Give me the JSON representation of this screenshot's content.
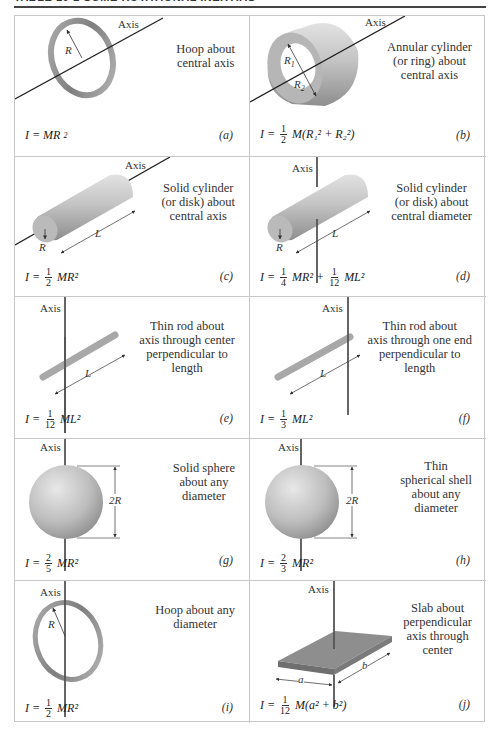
{
  "header": {
    "title": "TABLE 10-2 SOME ROTATIONAL INERTIAS"
  },
  "axis_label": "Axis",
  "panels": [
    {
      "id": "a",
      "letter": "(a)",
      "description": [
        "Hoop about",
        "central axis"
      ],
      "formula": {
        "prefix": "I = MR",
        "exp": "2"
      },
      "labels": [
        "R"
      ]
    },
    {
      "id": "b",
      "letter": "(b)",
      "description": [
        "Annular cylinder",
        "(or ring) about",
        "central axis"
      ],
      "formula": {
        "lhs": "I =",
        "frac": [
          "1",
          "2"
        ],
        "rest": "M(R₁² + R₂²)"
      },
      "labels": [
        "R1",
        "R2"
      ]
    },
    {
      "id": "c",
      "letter": "(c)",
      "description": [
        "Solid cylinder",
        "(or disk) about",
        "central axis"
      ],
      "formula": {
        "lhs": "I =",
        "frac": [
          "1",
          "2"
        ],
        "rest": "MR²"
      },
      "labels": [
        "R",
        "L"
      ]
    },
    {
      "id": "d",
      "letter": "(d)",
      "description": [
        "Solid cylinder",
        "(or disk) about",
        "central diameter"
      ],
      "formula": {
        "lhs": "I =",
        "frac": [
          "1",
          "4"
        ],
        "mid": "MR² +",
        "frac2": [
          "1",
          "12"
        ],
        "rest": "ML²"
      },
      "labels": [
        "R",
        "L"
      ]
    },
    {
      "id": "e",
      "letter": "(e)",
      "description": [
        "Thin rod about",
        "axis through center",
        "perpendicular to",
        "length"
      ],
      "formula": {
        "lhs": "I =",
        "frac": [
          "1",
          "12"
        ],
        "rest": "ML²"
      },
      "labels": [
        "L"
      ]
    },
    {
      "id": "f",
      "letter": "(f)",
      "description": [
        "Thin rod about",
        "axis through one end",
        "perpendicular to",
        "length"
      ],
      "formula": {
        "lhs": "I =",
        "frac": [
          "1",
          "3"
        ],
        "rest": "ML²"
      },
      "labels": [
        "L"
      ]
    },
    {
      "id": "g",
      "letter": "(g)",
      "description": [
        "Solid sphere",
        "about any",
        "diameter"
      ],
      "formula": {
        "lhs": "I =",
        "frac": [
          "2",
          "5"
        ],
        "rest": "MR²"
      },
      "labels": [
        "2R"
      ]
    },
    {
      "id": "h",
      "letter": "(h)",
      "description": [
        "Thin",
        "spherical shell",
        "about any",
        "diameter"
      ],
      "formula": {
        "lhs": "I =",
        "frac": [
          "2",
          "3"
        ],
        "rest": "MR²"
      },
      "labels": [
        "2R"
      ]
    },
    {
      "id": "i",
      "letter": "(i)",
      "description": [
        "Hoop about any",
        "diameter"
      ],
      "formula": {
        "lhs": "I =",
        "frac": [
          "1",
          "2"
        ],
        "rest": "MR²"
      },
      "labels": [
        "R"
      ]
    },
    {
      "id": "j",
      "letter": "(j)",
      "description": [
        "Slab about",
        "perpendicular",
        "axis through",
        "center"
      ],
      "formula": {
        "lhs": "I =",
        "frac": [
          "1",
          "12"
        ],
        "rest": "M(a² + b²)"
      },
      "labels": [
        "a",
        "b"
      ]
    }
  ],
  "colors": {
    "border": "#c8c8c8",
    "shape_light": "#d4d4d4",
    "shape_dark": "#8a8a8a",
    "axis_line": "#333333"
  }
}
